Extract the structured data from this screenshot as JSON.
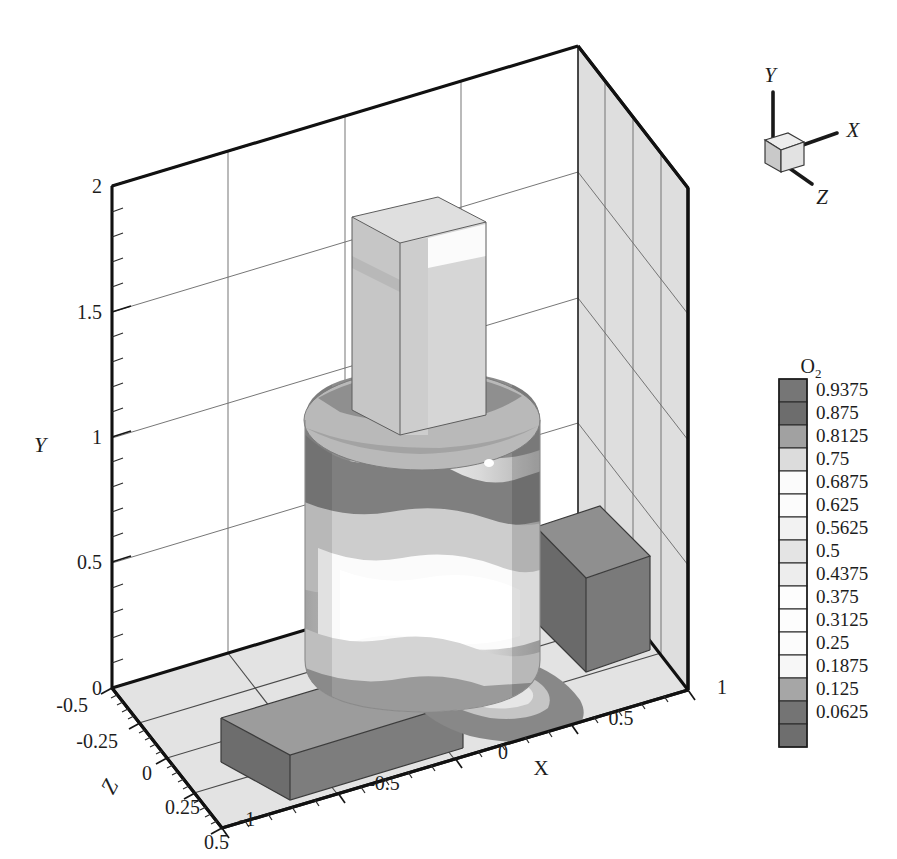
{
  "figure": {
    "kind": "3d-contour-flood-plot",
    "background": "#ffffff"
  },
  "axes": {
    "x": {
      "title": "X",
      "ticks": [
        "-1",
        "-0.5",
        "0",
        "0.5",
        "1"
      ],
      "values": [
        -1,
        -0.5,
        0,
        0.5,
        1
      ],
      "range": [
        -1,
        1
      ],
      "minor_per_interval": 5
    },
    "y": {
      "title": "Y",
      "ticks": [
        "0",
        "0.5",
        "1",
        "1.5",
        "2"
      ],
      "values": [
        0,
        0.5,
        1,
        1.5,
        2
      ],
      "range": [
        0,
        2
      ],
      "minor_per_interval": 5
    },
    "z": {
      "title": "Z",
      "ticks": [
        "-0.5",
        "-0.25",
        "0",
        "0.25",
        "0.5"
      ],
      "values": [
        -0.5,
        -0.25,
        0,
        0.25,
        0.5
      ],
      "range": [
        -0.5,
        0.5
      ],
      "minor_per_interval": 5
    }
  },
  "orientation_widget": {
    "x_label": "X",
    "y_label": "Y",
    "z_label": "Z",
    "cube_face_color": "#e8e8e8"
  },
  "colorbar": {
    "title": "O",
    "title_subscript": "2",
    "variable": "O2",
    "orientation": "vertical",
    "levels": [
      {
        "label": "0.9375",
        "value": 0.9375,
        "color": "#767676"
      },
      {
        "label": "0.875",
        "value": 0.875,
        "color": "#6d6d6d"
      },
      {
        "label": "0.8125",
        "value": 0.8125,
        "color": "#a1a1a1"
      },
      {
        "label": "0.75",
        "value": 0.75,
        "color": "#dcdcdc"
      },
      {
        "label": "0.6875",
        "value": 0.6875,
        "color": "#fbfbfb"
      },
      {
        "label": "0.625",
        "value": 0.625,
        "color": "#fcfcfc"
      },
      {
        "label": "0.5625",
        "value": 0.5625,
        "color": "#f2f2f2"
      },
      {
        "label": "0.5",
        "value": 0.5,
        "color": "#e4e4e4"
      },
      {
        "label": "0.4375",
        "value": 0.4375,
        "color": "#ededed"
      },
      {
        "label": "0.375",
        "value": 0.375,
        "color": "#fdfdfd"
      },
      {
        "label": "0.3125",
        "value": 0.3125,
        "color": "#fdfdfd"
      },
      {
        "label": "0.25",
        "value": 0.25,
        "color": "#fcfcfc"
      },
      {
        "label": "0.1875",
        "value": 0.1875,
        "color": "#f7f7f7"
      },
      {
        "label": "0.125",
        "value": 0.125,
        "color": "#a6a6a6"
      },
      {
        "label": "0.0625",
        "value": 0.0625,
        "color": "#747474"
      },
      {
        "label": "",
        "value": 0.0,
        "color": "#6e6e6e"
      }
    ]
  },
  "chart_data": {
    "type": "heatmap",
    "title": "",
    "xlabel": "X",
    "ylabel": "Y",
    "zlabel": "Z",
    "legend_title": "O2",
    "xlim": [
      -1,
      1
    ],
    "ylim": [
      0,
      2
    ],
    "zlim": [
      -0.5,
      0.5
    ],
    "grid": true,
    "legend_position": "right",
    "contour_levels": [
      0.0625,
      0.125,
      0.1875,
      0.25,
      0.3125,
      0.375,
      0.4375,
      0.5,
      0.5625,
      0.625,
      0.6875,
      0.75,
      0.8125,
      0.875,
      0.9375
    ],
    "geometry": [
      {
        "name": "combustor-cylinder",
        "shape": "cylinder",
        "center_x": -0.42,
        "radius": 0.46,
        "y_bottom": 0.02,
        "y_top": 1.12
      },
      {
        "name": "exhaust-chimney",
        "shape": "rectangular-column",
        "center_x": -0.3,
        "y_bottom": 1.12,
        "y_top": 2.02
      },
      {
        "name": "inlet-duct",
        "shape": "rectangular-slab",
        "x_from": -1.0,
        "x_to": -0.42,
        "y_top": 0.23,
        "z_center": 0.0
      },
      {
        "name": "outlet-duct",
        "shape": "rectangular-box",
        "x_center": 0.62,
        "y_bottom": 0.0,
        "y_top": 0.62
      }
    ],
    "field_description": "O2 mass fraction flooded on the solid surfaces of a cylindrical combustor with inlet and outlet ducts"
  }
}
